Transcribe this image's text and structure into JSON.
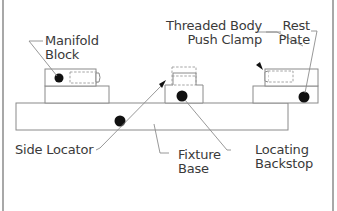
{
  "diagram": {
    "type": "fixture-assembly-callout",
    "labels": {
      "manifold_block": [
        "Manifold",
        "Block"
      ],
      "threaded_body_push_clamp": [
        "Threaded Body",
        "Push Clamp"
      ],
      "rest_plate": [
        "Rest",
        "Plate"
      ],
      "side_locator": [
        "Side Locator"
      ],
      "fixture_base": [
        "Fixture",
        "Base"
      ],
      "locating_backstop": [
        "Locating",
        "Backstop"
      ]
    },
    "colors": {
      "outline": "#8a8a8a",
      "dot": "#111111",
      "text": "#3a3a3a",
      "frame": "#6e6e6e",
      "background": "#ffffff"
    }
  }
}
